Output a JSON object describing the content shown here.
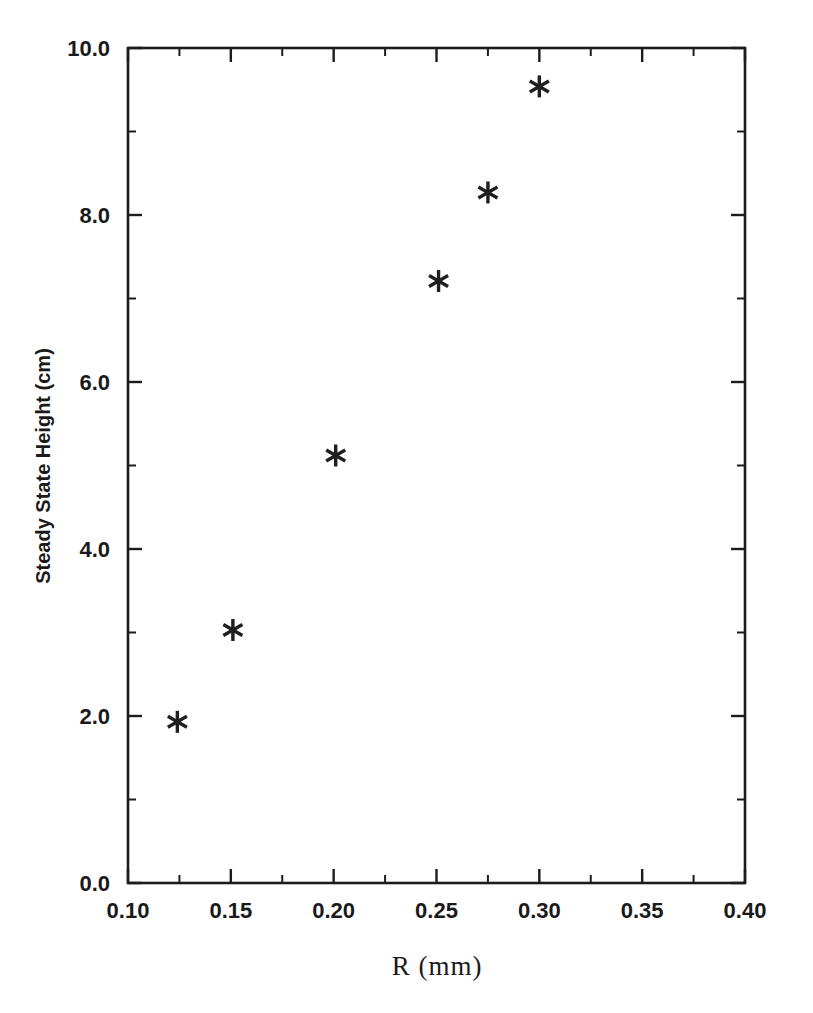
{
  "chart_data": {
    "type": "scatter",
    "title": "",
    "xlabel": "R  (mm)",
    "ylabel": "Steady State Height (cm)",
    "xlim": [
      0.1,
      0.4
    ],
    "ylim": [
      0.0,
      10.0
    ],
    "grid": false,
    "legend": null,
    "marker": "asterisk",
    "marker_color": "#1f1f1f",
    "x": [
      0.124,
      0.151,
      0.201,
      0.251,
      0.275,
      0.3
    ],
    "y": [
      1.93,
      3.03,
      5.12,
      7.21,
      8.27,
      9.54
    ],
    "points": [
      {
        "x": 0.124,
        "y": 1.93
      },
      {
        "x": 0.151,
        "y": 3.03
      },
      {
        "x": 0.201,
        "y": 5.12
      },
      {
        "x": 0.251,
        "y": 7.21
      },
      {
        "x": 0.275,
        "y": 8.27
      },
      {
        "x": 0.3,
        "y": 9.54
      }
    ],
    "xticks": [
      0.1,
      0.15,
      0.2,
      0.25,
      0.3,
      0.35,
      0.4
    ],
    "xticklabels": [
      "0.10",
      "0.15",
      "0.20",
      "0.25",
      "0.30",
      "0.35",
      "0.40"
    ],
    "xminor_step": 0.025,
    "yticks": [
      0.0,
      2.0,
      4.0,
      6.0,
      8.0,
      10.0
    ],
    "yticklabels": [
      "0.0",
      "2.0",
      "4.0",
      "6.0",
      "8.0",
      "10.0"
    ],
    "yminor_step": 1.0,
    "axis_color": "#1c1c1c",
    "background": "#ffffff"
  }
}
